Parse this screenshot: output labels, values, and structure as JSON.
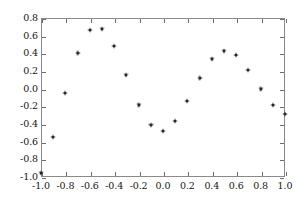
{
  "chart_data": {
    "type": "scatter",
    "title": "",
    "xlabel": "",
    "ylabel": "",
    "xlim": [
      -1.0,
      1.0
    ],
    "ylim": [
      -1.0,
      0.8
    ],
    "grid": false,
    "legend": null,
    "marker": "dot-plus",
    "marker_color": "#1a1a1a",
    "x": [
      -1.0,
      -0.9,
      -0.8,
      -0.7,
      -0.6,
      -0.5,
      -0.4,
      -0.3,
      -0.2,
      -0.1,
      0.0,
      0.1,
      0.2,
      0.3,
      0.4,
      0.5,
      0.6,
      0.7,
      0.8,
      0.9,
      1.0
    ],
    "values": [
      -0.95,
      -0.55,
      -0.05,
      0.4,
      0.66,
      0.68,
      0.48,
      0.16,
      -0.18,
      -0.41,
      -0.48,
      -0.37,
      -0.14,
      0.12,
      0.34,
      0.43,
      0.38,
      0.21,
      0.0,
      -0.19,
      -0.29
    ],
    "xticks": [
      -1.0,
      -0.8,
      -0.6,
      -0.4,
      -0.2,
      0.0,
      0.2,
      0.4,
      0.6,
      0.8,
      1.0
    ],
    "xticklabels": [
      "-1.0",
      "-0.8",
      "-0.6",
      "-0.4",
      "-0.2",
      "0.0",
      "0.2",
      "0.4",
      "0.6",
      "0.8",
      "1.0"
    ],
    "yticks": [
      0.8,
      0.6,
      0.4,
      0.2,
      0.0,
      -0.2,
      -0.4,
      -0.6,
      -0.8,
      -1.0
    ],
    "yticklabels": [
      "0.8",
      "0.6",
      "0.4",
      "0.2",
      "0.0",
      "-0.2",
      "-0.4",
      "-0.6",
      "-0.8",
      "-1.0"
    ]
  }
}
